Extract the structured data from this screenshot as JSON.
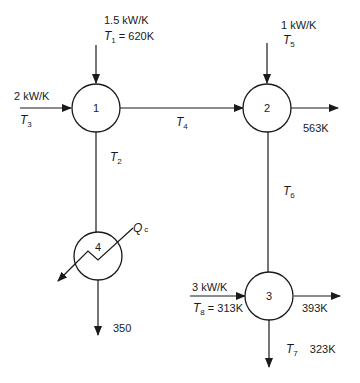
{
  "diagram": {
    "type": "heat-mixing-network",
    "nodes": [
      {
        "id": "1",
        "label": "1"
      },
      {
        "id": "2",
        "label": "2"
      },
      {
        "id": "3",
        "label": "3"
      },
      {
        "id": "4",
        "label": "4",
        "kind": "heat-exchanger"
      }
    ],
    "streams": {
      "s1": {
        "flow": "1.5 kW/K",
        "temp_var": "T",
        "temp_sub": "1",
        "temp_val": " = 620K"
      },
      "s3": {
        "flow": "2 kW/K",
        "temp_var": "T",
        "temp_sub": "3"
      },
      "s4": {
        "temp_var": "T",
        "temp_sub": "4"
      },
      "s2": {
        "temp_var": "T",
        "temp_sub": "2"
      },
      "s5": {
        "flow": "1 kW/K",
        "temp_var": "T",
        "temp_sub": "5"
      },
      "s2_out": {
        "temp": "563K"
      },
      "s6": {
        "temp_var": "T",
        "temp_sub": "6"
      },
      "s8": {
        "flow": "3 kW/K",
        "temp_var": "T",
        "temp_sub": "8",
        "temp_val": " = 313K"
      },
      "s3_out": {
        "temp": "393K"
      },
      "s7": {
        "temp_var": "T",
        "temp_sub": "7",
        "temp_val": "323K"
      },
      "s4_out": {
        "temp": "350"
      },
      "qc": {
        "var": "Q",
        "sub": "c"
      }
    },
    "edges": [
      {
        "from": "source",
        "to": "1",
        "label": "1.5 kW/K, T1 = 620K"
      },
      {
        "from": "source",
        "to": "1",
        "label": "2 kW/K, T3"
      },
      {
        "from": "1",
        "to": "2",
        "label": "T4"
      },
      {
        "from": "1",
        "to": "4",
        "label": "T2"
      },
      {
        "from": "source",
        "to": "2",
        "label": "1 kW/K, T5"
      },
      {
        "from": "2",
        "to": "sink",
        "label": "563K"
      },
      {
        "from": "2",
        "to": "3",
        "label": "T6"
      },
      {
        "from": "source",
        "to": "3",
        "label": "3 kW/K, T8 = 313K"
      },
      {
        "from": "3",
        "to": "sink",
        "label": "393K"
      },
      {
        "from": "3",
        "to": "sink",
        "label": "T7 323K"
      },
      {
        "from": "4",
        "to": "sink",
        "label": "350"
      },
      {
        "from": "4",
        "to": "sink",
        "label": "Qc"
      }
    ]
  }
}
